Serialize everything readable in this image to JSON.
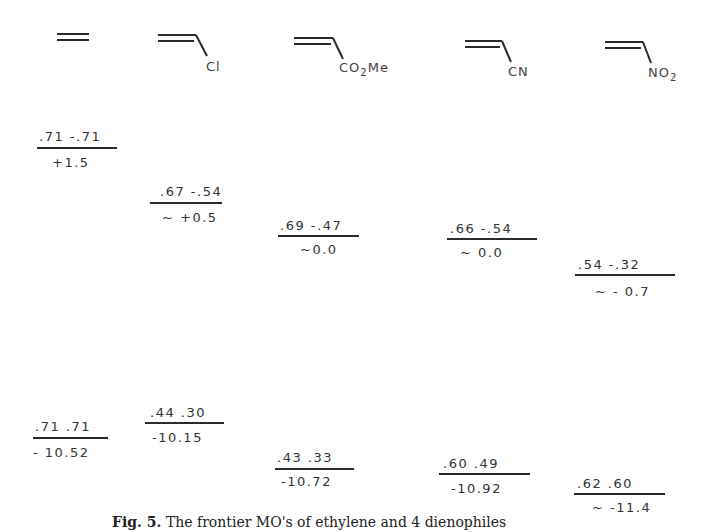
{
  "compounds": [
    {
      "id": "ethylene",
      "substituent": "",
      "substituent_sub": "",
      "substituent_after": ""
    },
    {
      "id": "vinyl-chloride",
      "substituent": "Cl",
      "substituent_sub": "",
      "substituent_after": ""
    },
    {
      "id": "methyl-acrylate",
      "substituent": "CO",
      "substituent_sub": "2",
      "substituent_after": "Me"
    },
    {
      "id": "acrylonitrile",
      "substituent": "CN",
      "substituent_sub": "",
      "substituent_after": ""
    },
    {
      "id": "nitroethylene",
      "substituent": "NO",
      "substituent_sub": "2",
      "substituent_after": ""
    }
  ],
  "lumo": [
    {
      "coefficients": ".71  -.71",
      "energy": "+1.5"
    },
    {
      "coefficients": ".67 -.54",
      "energy": "~ +0.5"
    },
    {
      "coefficients": ".69 -.47",
      "energy": "~0.0"
    },
    {
      "coefficients": ".66  -.54",
      "energy": "~ 0.0"
    },
    {
      "coefficients": ".54   -.32",
      "energy": "~ - 0.7"
    }
  ],
  "homo": [
    {
      "coefficients": ".71  .71",
      "energy": "- 10.52"
    },
    {
      "coefficients": ".44 .30",
      "energy": "-10.15"
    },
    {
      "coefficients": ".43  .33",
      "energy": "-10.72"
    },
    {
      "coefficients": ".60   .49",
      "energy": "-10.92"
    },
    {
      "coefficients": ".62   .60",
      "energy": "~ -11.4"
    }
  ],
  "caption": {
    "label": "Fig. 5.",
    "text": "The frontier MO's of ethylene and 4 dienophiles"
  }
}
